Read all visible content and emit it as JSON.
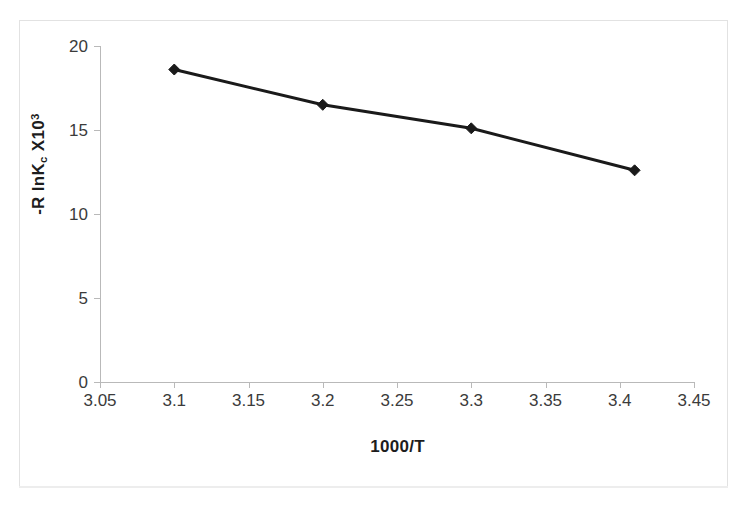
{
  "figure": {
    "background_color": "#ffffff",
    "frame_color": "#e2e2e2"
  },
  "chart_data": {
    "type": "line",
    "title": "",
    "subtitle": "",
    "xlabel": "1000/T",
    "ylabel": "-R lnKc X103",
    "ylabel_parts": {
      "prefix": "-R lnK",
      "subscript": "c",
      "middle": " X10",
      "superscript": "3"
    },
    "x": [
      3.1,
      3.2,
      3.3,
      3.41
    ],
    "values": [
      18.6,
      16.5,
      15.1,
      12.6
    ],
    "series": [
      {
        "name": "-R lnKc X10^3",
        "x": [
          3.1,
          3.2,
          3.3,
          3.41
        ],
        "values": [
          18.6,
          16.5,
          15.1,
          12.6
        ]
      }
    ],
    "xlim": [
      3.05,
      3.45
    ],
    "ylim": [
      0,
      20
    ],
    "xticks": [
      "3.05",
      "3.1",
      "3.15",
      "3.2",
      "3.25",
      "3.3",
      "3.35",
      "3.4",
      "3.45"
    ],
    "xtick_values": [
      3.05,
      3.1,
      3.15,
      3.2,
      3.25,
      3.3,
      3.35,
      3.4,
      3.45
    ],
    "yticks": [
      "0",
      "5",
      "10",
      "15",
      "20"
    ],
    "ytick_values": [
      0,
      5,
      10,
      15,
      20
    ],
    "grid": false,
    "legend": false,
    "legend_position": "none",
    "marker": "diamond",
    "marker_color": "#1a1a1a",
    "line_color": "#1a1a1a",
    "line_width": 3,
    "annotations": []
  }
}
